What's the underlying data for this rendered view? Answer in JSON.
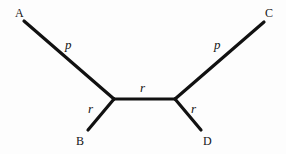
{
  "figure": {
    "width": 286,
    "height": 154,
    "background_color": "#fdfdfd",
    "line_color": "#111111",
    "text_color": "#141414",
    "line_width": 3.2
  },
  "nodes": {
    "internal_left": {
      "x": 114,
      "y": 99
    },
    "internal_right": {
      "x": 175,
      "y": 99
    },
    "tip_a": {
      "x": 24,
      "y": 21
    },
    "tip_b": {
      "x": 88,
      "y": 130
    },
    "tip_c": {
      "x": 264,
      "y": 22
    },
    "tip_d": {
      "x": 201,
      "y": 130
    }
  },
  "branches": [
    {
      "id": "branch-a",
      "from": "tip_a",
      "to": "internal_left",
      "label": "p",
      "label_x": 65,
      "label_y": 38
    },
    {
      "id": "branch-b",
      "from": "tip_b",
      "to": "internal_left",
      "label": "r",
      "label_x": 88,
      "label_y": 102
    },
    {
      "id": "branch-internal",
      "from": "internal_left",
      "to": "internal_right",
      "label": "r",
      "label_x": 140,
      "label_y": 81
    },
    {
      "id": "branch-c",
      "from": "tip_c",
      "to": "internal_right",
      "label": "p",
      "label_x": 214,
      "label_y": 38
    },
    {
      "id": "branch-d",
      "from": "tip_d",
      "to": "internal_right",
      "label": "r",
      "label_x": 191,
      "label_y": 102
    }
  ],
  "taxa": [
    {
      "id": "taxon-a",
      "label": "A",
      "x": 15,
      "y": 7
    },
    {
      "id": "taxon-b",
      "label": "B",
      "x": 76,
      "y": 135
    },
    {
      "id": "taxon-c",
      "label": "C",
      "x": 265,
      "y": 7
    },
    {
      "id": "taxon-d",
      "label": "D",
      "x": 203,
      "y": 135
    }
  ]
}
